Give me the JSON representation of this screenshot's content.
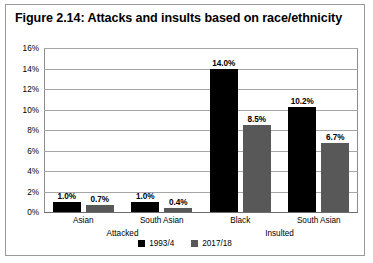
{
  "figure": {
    "title": "Figure 2.14: Attacks and insults based on race/ethnicity"
  },
  "chart_data": {
    "type": "bar",
    "title": "Figure 2.14: Attacks and insults based on race/ethnicity",
    "xlabel": "",
    "ylabel": "",
    "ylim": [
      0,
      16
    ],
    "ytick_labels": [
      "0%",
      "2%",
      "4%",
      "6%",
      "8%",
      "10%",
      "12%",
      "14%",
      "16%"
    ],
    "ytick_values": [
      0,
      2,
      4,
      6,
      8,
      10,
      12,
      14,
      16
    ],
    "grid": true,
    "legend_position": "bottom",
    "categories": [
      "Asian",
      "South Asian",
      "Black",
      "South Asian"
    ],
    "groups": [
      {
        "label": "Attacked",
        "categories": [
          "Asian",
          "South Asian"
        ]
      },
      {
        "label": "Insulted",
        "categories": [
          "Black",
          "South Asian"
        ]
      }
    ],
    "series": [
      {
        "name": "1993/4",
        "color": "#000000",
        "values": [
          1.0,
          1.0,
          14.0,
          10.2
        ],
        "data_labels": [
          "1.0%",
          "1.0%",
          "14.0%",
          "10.2%"
        ]
      },
      {
        "name": "2017/18",
        "color": "#585858",
        "values": [
          0.7,
          0.4,
          8.5,
          6.7
        ],
        "data_labels": [
          "0.7%",
          "0.4%",
          "8.5%",
          "6.7%"
        ]
      }
    ]
  }
}
